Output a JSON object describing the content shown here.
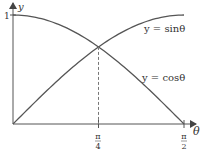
{
  "chart_data": {
    "type": "line",
    "title": "",
    "xlabel": "θ",
    "ylabel": "y",
    "xlim": [
      0,
      1.5707963
    ],
    "ylim": [
      0,
      1
    ],
    "grid": false,
    "series": [
      {
        "name": "y = sin θ",
        "function": "sin",
        "label": "y = sinθ"
      },
      {
        "name": "y = cos θ",
        "function": "cos",
        "label": "y = cosθ"
      }
    ],
    "x_ticks": [
      {
        "value": 0.7853982,
        "num": "π",
        "den": "4"
      },
      {
        "value": 1.5707963,
        "num": "π",
        "den": "2"
      }
    ],
    "y_ticks": [
      {
        "value": 1,
        "label": "1"
      }
    ],
    "annotations": [
      {
        "type": "dashed-vertical",
        "x": 0.7853982,
        "note": "intersection of sin θ and cos θ at θ = π/4"
      }
    ],
    "legend": "inline-labels",
    "colors": {
      "axis": "#555555",
      "curve": "#555555",
      "dashed": "#777777"
    }
  }
}
